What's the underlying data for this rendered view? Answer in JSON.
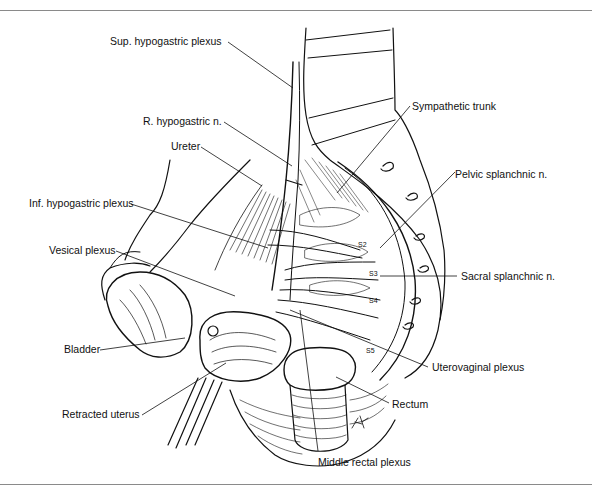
{
  "figure": {
    "type": "anatomical illustration",
    "artist_initials": "FK",
    "sacral_segment_marks": [
      "S2",
      "S3",
      "S4",
      "S5"
    ],
    "line_color": "#111111",
    "rule_color": "#8a8a8a",
    "labels": [
      {
        "id": "sup-hypogastric-plexus",
        "text": "Sup. hypogastric plexus"
      },
      {
        "id": "r-hypogastric-n",
        "text": "R. hypogastric n."
      },
      {
        "id": "ureter",
        "text": "Ureter"
      },
      {
        "id": "inf-hypogastric-plexus",
        "text": "Inf. hypogastric plexus"
      },
      {
        "id": "vesical-plexus",
        "text": "Vesical plexus"
      },
      {
        "id": "bladder",
        "text": "Bladder"
      },
      {
        "id": "retracted-uterus",
        "text": "Retracted uterus"
      },
      {
        "id": "sympathetic-trunk",
        "text": "Sympathetic trunk"
      },
      {
        "id": "pelvic-splanchnic-n",
        "text": "Pelvic splanchnic n."
      },
      {
        "id": "sacral-splanchnic-n",
        "text": "Sacral splanchnic n."
      },
      {
        "id": "uterovaginal-plexus",
        "text": "Uterovaginal plexus"
      },
      {
        "id": "rectum",
        "text": "Rectum"
      },
      {
        "id": "middle-rectal-plexus",
        "text": "Middle rectal plexus"
      }
    ]
  }
}
